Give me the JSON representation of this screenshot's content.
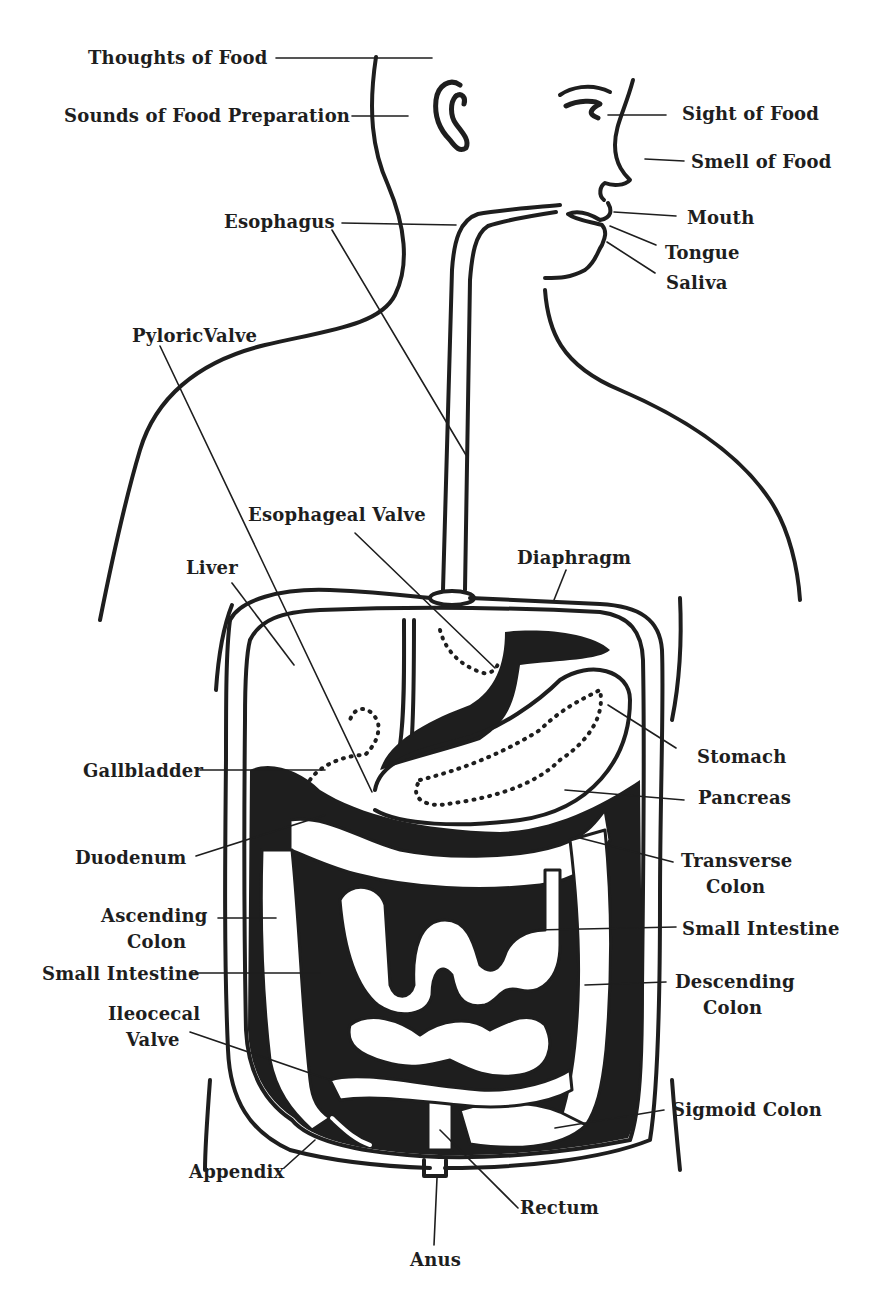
{
  "diagram": {
    "colors": {
      "ink": "#1e1e1e",
      "background": "#ffffff"
    },
    "labels": {
      "thoughts_of_food": "Thoughts of Food",
      "sounds_of_food_preparation": "Sounds of Food Preparation",
      "sight_of_food": "Sight of Food",
      "smell_of_food": "Smell of Food",
      "esophagus": "Esophagus",
      "mouth": "Mouth",
      "tongue": "Tongue",
      "saliva": "Saliva",
      "pyloric_valve": "PyloricValve",
      "esophageal_valve": "Esophageal Valve",
      "diaphragm": "Diaphragm",
      "liver": "Liver",
      "stomach": "Stomach",
      "gallbladder": "Gallbladder",
      "pancreas": "Pancreas",
      "duodenum": "Duodenum",
      "transverse_colon_1": "Transverse",
      "transverse_colon_2": "Colon",
      "ascending_colon_1": "Ascending",
      "ascending_colon_2": "Colon",
      "small_intestine_right": "Small Intestine",
      "small_intestine_left": "Small Intestine",
      "descending_colon_1": "Descending",
      "descending_colon_2": "Colon",
      "ileocecal_valve_1": "Ileocecal",
      "ileocecal_valve_2": "Valve",
      "sigmoid_colon": "Sigmoid Colon",
      "appendix": "Appendix",
      "rectum": "Rectum",
      "anus": "Anus"
    }
  }
}
